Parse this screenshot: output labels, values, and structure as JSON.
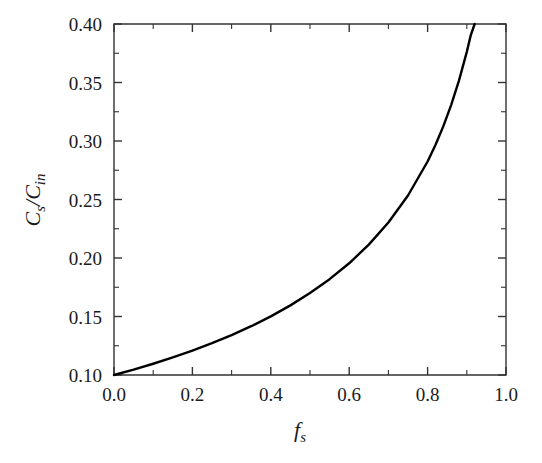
{
  "chart_data": {
    "type": "line",
    "title": "",
    "subtitle": "",
    "xlabel": "f_s",
    "xlabel_main": "f",
    "xlabel_sub": "s",
    "ylabel": "C_s/C_in",
    "ylabel_parts": [
      "C",
      "s",
      "/",
      "C",
      "in"
    ],
    "xlim": [
      0.0,
      1.0
    ],
    "ylim": [
      0.1,
      0.4
    ],
    "grid": false,
    "legend": null,
    "x_ticks": [
      0.0,
      0.2,
      0.4,
      0.6,
      0.8,
      1.0
    ],
    "x_tick_labels": [
      "0.0",
      "0.2",
      "0.4",
      "0.6",
      "0.8",
      "1.0"
    ],
    "x_minor_step": 0.1,
    "y_ticks": [
      0.1,
      0.15,
      0.2,
      0.25,
      0.3,
      0.35,
      0.4
    ],
    "y_tick_labels": [
      "0.10",
      "0.15",
      "0.20",
      "0.25",
      "0.30",
      "0.35",
      "0.40"
    ],
    "y_minor_step": 0.025,
    "curve_color": "#000000",
    "frame_color": "#333333",
    "background_color": "#ffffff",
    "series": [
      {
        "name": "Cs/Cin vs fs",
        "x": [
          0.0,
          0.05,
          0.1,
          0.15,
          0.2,
          0.25,
          0.3,
          0.35,
          0.4,
          0.45,
          0.5,
          0.55,
          0.6,
          0.65,
          0.7,
          0.75,
          0.8,
          0.82,
          0.84,
          0.86,
          0.88,
          0.9,
          0.91,
          0.92,
          0.93,
          0.94,
          0.95,
          0.96,
          0.965,
          0.97,
          0.975,
          0.98,
          0.983,
          0.986,
          0.989,
          0.991,
          0.993,
          0.994,
          0.995
        ],
        "values": [
          0.1,
          0.1046,
          0.1096,
          0.115,
          0.1208,
          0.1272,
          0.1341,
          0.1417,
          0.1501,
          0.1595,
          0.17,
          0.1819,
          0.1955,
          0.2114,
          0.2303,
          0.2534,
          0.2825,
          0.2966,
          0.3125,
          0.3307,
          0.3516,
          0.3762,
          0.3903,
          0.4,
          0.4,
          0.4,
          0.4,
          0.4,
          0.4,
          0.4,
          0.4,
          0.4,
          0.4,
          0.4,
          0.4,
          0.4,
          0.4,
          0.4,
          0.4
        ]
      }
    ]
  }
}
